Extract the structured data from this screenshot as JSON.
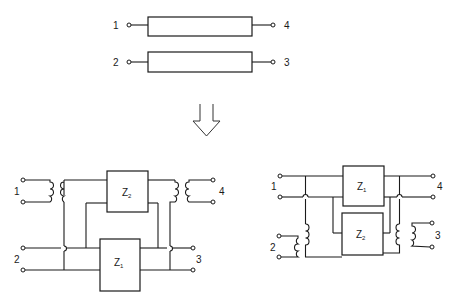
{
  "top_network": {
    "line_a": {
      "left_port": "1",
      "right_port": "4"
    },
    "line_b": {
      "left_port": "2",
      "right_port": "3"
    }
  },
  "transform_arrow": {
    "direction": "down"
  },
  "left_circuit": {
    "ports": {
      "p1": "1",
      "p2": "2",
      "p3": "3",
      "p4": "4"
    },
    "impedances": {
      "upper": {
        "base": "Z",
        "sub": "2"
      },
      "lower": {
        "base": "Z",
        "sub": "1"
      }
    }
  },
  "right_circuit": {
    "ports": {
      "p1": "1",
      "p2": "2",
      "p3": "3",
      "p4": "4"
    },
    "impedances": {
      "upper": {
        "base": "Z",
        "sub": "1"
      },
      "lower": {
        "base": "Z",
        "sub": "2"
      }
    }
  },
  "colors": {
    "ink": "#1a1a1a",
    "background": "#ffffff"
  }
}
